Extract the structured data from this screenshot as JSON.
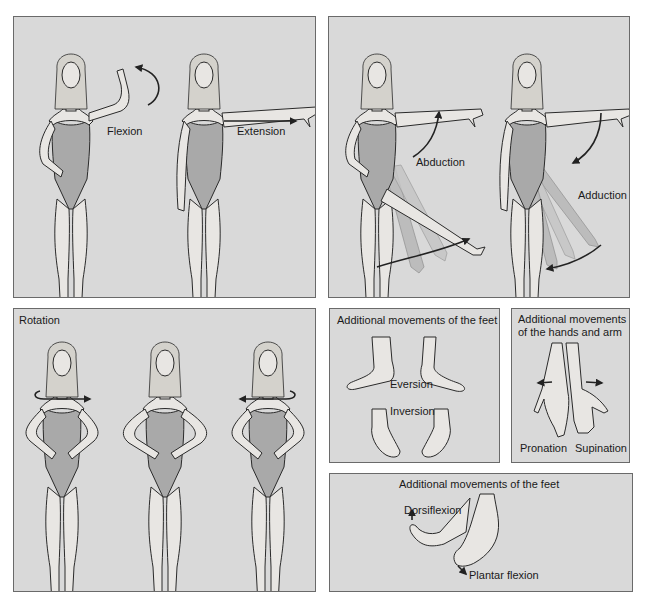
{
  "colors": {
    "panel_background": "#d9d9d9",
    "panel_border": "#6a6a6a",
    "skin": "#e8e6e3",
    "swimsuit": "#a9a9a9",
    "outline": "#2a2a2a"
  },
  "panels": {
    "flexion_extension": {
      "labels": {
        "flexion": "Flexion",
        "extension": "Extension"
      }
    },
    "abduction_adduction": {
      "labels": {
        "abduction": "Abduction",
        "adduction": "Adduction"
      }
    },
    "rotation": {
      "title": "Rotation"
    },
    "feet_eversion_inversion": {
      "title": "Additional movements of the feet",
      "labels": {
        "eversion": "Eversion",
        "inversion": "Inversion"
      }
    },
    "hands_arm": {
      "title_line1": "Additional movements",
      "title_line2": "of the hands and arm",
      "labels": {
        "pronation": "Pronation",
        "supination": "Supination"
      }
    },
    "feet_dorsi_plantar": {
      "title": "Additional movements of the feet",
      "labels": {
        "dorsiflexion": "Dorsiflexion",
        "plantar_flexion": "Plantar flexion"
      }
    }
  }
}
